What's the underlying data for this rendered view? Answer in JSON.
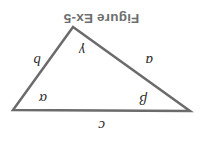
{
  "figure": {
    "title": "Figure Ex-5",
    "title_color": "#6e6e6e",
    "background_color": "#ffffff",
    "orientation": "rotated-180",
    "stroke_color": "#6b6b6b",
    "stroke_width": 2.5,
    "shape": "triangle",
    "vertices": [
      {
        "name": "left-vertex",
        "x": 13,
        "y": 57
      },
      {
        "name": "right-vertex",
        "x": 190,
        "y": 58
      },
      {
        "name": "bottom-vertex",
        "x": 130,
        "y": 141
      }
    ],
    "side_labels": [
      {
        "id": "a",
        "text": "a",
        "x": 50,
        "y": 100
      },
      {
        "id": "b",
        "text": "b",
        "x": 162,
        "y": 100
      },
      {
        "id": "c",
        "text": "c",
        "x": 98,
        "y": 35
      }
    ],
    "angle_labels": [
      {
        "id": "alpha",
        "text": "α",
        "x": 156,
        "y": 62
      },
      {
        "id": "beta",
        "text": "β",
        "x": 56,
        "y": 61
      },
      {
        "id": "gamma",
        "text": "γ",
        "x": 118,
        "y": 110
      }
    ]
  }
}
